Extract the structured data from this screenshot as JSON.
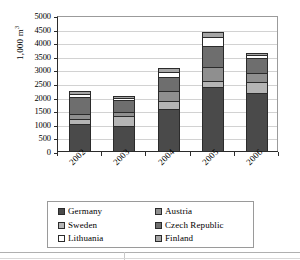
{
  "chart_data": {
    "type": "bar",
    "subtype": "stacked-column",
    "title": "",
    "xlabel": "",
    "ylabel": "1,000 m3",
    "ylabel_display": "1,000 m",
    "ylabel_superscript": "3",
    "ylim": [
      0,
      5000
    ],
    "ytick_step": 500,
    "yticks": [
      0,
      500,
      1000,
      1500,
      2000,
      2500,
      3000,
      3500,
      4000,
      4500,
      5000
    ],
    "ytick_labels": [
      "0",
      "500",
      "1000",
      "1500",
      "2000",
      "2500",
      "3000",
      "3500",
      "4000",
      "4500",
      "5000"
    ],
    "categories": [
      "2002",
      "2003",
      "2004",
      "2005",
      "2006"
    ],
    "grid": "horizontal",
    "legend_position": "bottom",
    "series": [
      {
        "name": "Germany",
        "color": "#4a4a4a",
        "values": [
          950,
          880,
          1510,
          2300,
          2110
        ]
      },
      {
        "name": "Sweden",
        "color": "#b5b5b5",
        "values": [
          200,
          370,
          300,
          250,
          380
        ]
      },
      {
        "name": "Austria",
        "color": "#8f8f8f",
        "values": [
          190,
          130,
          360,
          500,
          360
        ]
      },
      {
        "name": "Czech Republic",
        "color": "#6e6e6e",
        "values": [
          600,
          450,
          520,
          760,
          520
        ]
      },
      {
        "name": "Lithuania",
        "color": "#ffffff",
        "values": [
          110,
          70,
          170,
          360,
          110
        ]
      },
      {
        "name": "Finland",
        "color": "#a6a6a6",
        "values": [
          110,
          70,
          140,
          180,
          80
        ]
      }
    ],
    "totals": [
      2160,
      1970,
      3000,
      4350,
      3560
    ]
  },
  "legend": {
    "entries": [
      {
        "label": "Germany",
        "swatch": "#4a4a4a"
      },
      {
        "label": "Austria",
        "swatch": "#8f8f8f"
      },
      {
        "label": "Sweden",
        "swatch": "#b5b5b5"
      },
      {
        "label": "Czech Republic",
        "swatch": "#6e6e6e"
      },
      {
        "label": "Lithuania",
        "swatch": "#ffffff"
      },
      {
        "label": "Finland",
        "swatch": "#a6a6a6"
      }
    ]
  }
}
